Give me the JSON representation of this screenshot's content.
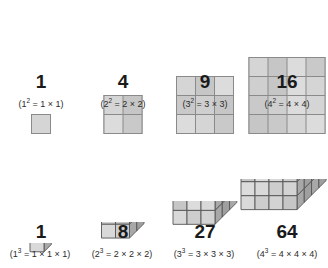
{
  "figure": {
    "title_visible": false,
    "background_color": "#ffffff",
    "ink_color": "#1a1a1a",
    "face_colors": {
      "front": "#d2d2d2",
      "top": "#bdbdbd",
      "side": "#a8a8a8",
      "outline": "#555555",
      "grid_line": "#8a8a8a"
    }
  },
  "squares": {
    "row_label": "square numbers",
    "items": [
      {
        "n": 1,
        "side": 1,
        "value_label": "1",
        "formula_prefix": "(1",
        "formula_exponent": "2",
        "formula_suffix": " = 1 × 1)",
        "formula_plain": "(1² = 1 × 1)",
        "cells": 1
      },
      {
        "n": 2,
        "side": 2,
        "value_label": "4",
        "formula_prefix": "(2",
        "formula_exponent": "2",
        "formula_suffix": " = 2 × 2)",
        "formula_plain": "(2² = 2 × 2)",
        "cells": 4
      },
      {
        "n": 3,
        "side": 3,
        "value_label": "9",
        "formula_prefix": "(3",
        "formula_exponent": "2",
        "formula_suffix": " = 3 × 3)",
        "formula_plain": "(3² = 3 × 3)",
        "cells": 9
      },
      {
        "n": 4,
        "side": 4,
        "value_label": "16",
        "formula_prefix": "(4",
        "formula_exponent": "2",
        "formula_suffix": " = 4 × 4)",
        "formula_plain": "(4² = 4 × 4)",
        "cells": 16
      }
    ]
  },
  "cubes": {
    "row_label": "cube numbers",
    "items": [
      {
        "n": 1,
        "side": 1,
        "value_label": "1",
        "formula_prefix": "(1",
        "formula_exponent": "3",
        "formula_suffix": " = 1 × 1 × 1)",
        "formula_plain": "(1³ = 1 × 1 × 1)",
        "cells": 1
      },
      {
        "n": 2,
        "side": 2,
        "value_label": "8",
        "formula_prefix": "(2",
        "formula_exponent": "3",
        "formula_suffix": " = 2 × 2 × 2)",
        "formula_plain": "(2³ = 2 × 2 × 2)",
        "cells": 8
      },
      {
        "n": 3,
        "side": 3,
        "value_label": "27",
        "formula_prefix": "(3",
        "formula_exponent": "3",
        "formula_suffix": " = 3 × 3 × 3)",
        "formula_plain": "(3³ = 3 × 3 × 3)",
        "cells": 27
      },
      {
        "n": 4,
        "side": 4,
        "value_label": "64",
        "formula_prefix": "(4",
        "formula_exponent": "3",
        "formula_suffix": " = 4 × 4 × 4)",
        "formula_plain": "(4³ = 4 × 4 × 4)",
        "cells": 64
      }
    ]
  }
}
